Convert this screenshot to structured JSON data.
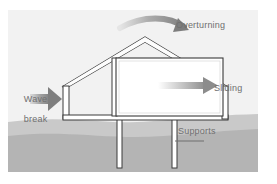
{
  "figure": {
    "background_color": "#f2f2f2",
    "label_color": "#6f6f6f"
  },
  "labels": {
    "overturning": "Overturning",
    "sliding": "Sliding",
    "supports": "Supports",
    "wave_break_line1": "Wave",
    "wave_break_line2": "break"
  },
  "elements": {
    "house_name": "cutaway-house",
    "roof_name": "gable-roof",
    "room_name": "interior-room",
    "post_left_name": "support-post-left",
    "post_right_name": "support-post-right",
    "ground_name": "ground-terrain"
  },
  "colors": {
    "ground_upper": "#c9c9c9",
    "ground_lower": "#b4b4b4",
    "outline": "#3a3a3a",
    "wall_fill": "#ffffff",
    "roof_fill": "#fdfdfd",
    "arrow": "#8c8c8c"
  }
}
